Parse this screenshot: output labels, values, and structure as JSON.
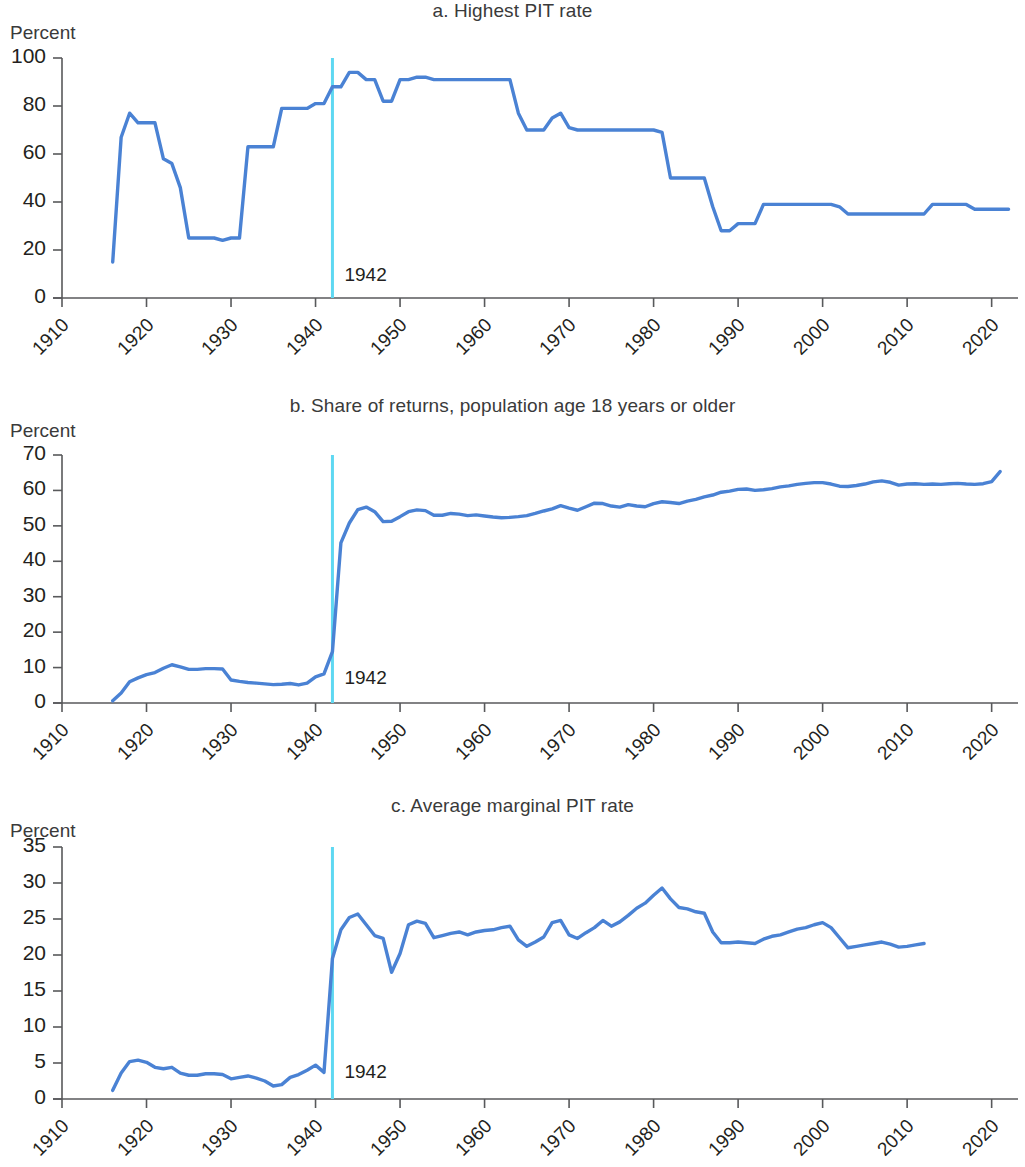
{
  "figure": {
    "axis_unit_label": "Percent",
    "marker_label": "1942",
    "series_color": "#4a82d4",
    "marker_color": "#5ed8f2",
    "axis_color": "#58595b"
  },
  "panels": [
    {
      "key": "a",
      "title": "a. Highest PIT rate",
      "unit": "Percent",
      "annotation": "1942"
    },
    {
      "key": "b",
      "title": "b. Share of returns, population age 18 years or older",
      "unit": "Percent",
      "annotation": "1942"
    },
    {
      "key": "c",
      "title": "c. Average marginal PIT rate",
      "unit": "Percent",
      "annotation": "1942"
    }
  ],
  "chart_data": [
    {
      "type": "line",
      "panel": "a",
      "title": "a. Highest PIT rate",
      "xlabel": "",
      "ylabel": "Percent",
      "xlim": [
        1910,
        2023
      ],
      "ylim": [
        0,
        100
      ],
      "yticks": [
        0,
        20,
        40,
        60,
        80,
        100
      ],
      "xticks": [
        1910,
        1920,
        1930,
        1940,
        1950,
        1960,
        1970,
        1980,
        1990,
        2000,
        2010,
        2020
      ],
      "grid": false,
      "legend": "none",
      "annotations": [
        {
          "type": "vline",
          "x": 1942,
          "label": "1942",
          "color": "#5ed8f2"
        }
      ],
      "series": [
        {
          "name": "Highest PIT rate",
          "color": "#4a82d4",
          "x": [
            1916,
            1917,
            1918,
            1919,
            1920,
            1921,
            1922,
            1923,
            1924,
            1925,
            1926,
            1927,
            1928,
            1929,
            1930,
            1931,
            1932,
            1933,
            1934,
            1935,
            1936,
            1937,
            1938,
            1939,
            1940,
            1941,
            1942,
            1943,
            1944,
            1945,
            1946,
            1947,
            1948,
            1949,
            1950,
            1951,
            1952,
            1953,
            1954,
            1955,
            1956,
            1957,
            1958,
            1959,
            1960,
            1961,
            1962,
            1963,
            1964,
            1965,
            1966,
            1967,
            1968,
            1969,
            1970,
            1971,
            1972,
            1973,
            1974,
            1975,
            1976,
            1977,
            1978,
            1979,
            1980,
            1981,
            1982,
            1983,
            1984,
            1985,
            1986,
            1987,
            1988,
            1989,
            1990,
            1991,
            1992,
            1993,
            1994,
            1995,
            1996,
            1997,
            1998,
            1999,
            2000,
            2001,
            2002,
            2003,
            2004,
            2005,
            2006,
            2007,
            2008,
            2009,
            2010,
            2011,
            2012,
            2013,
            2014,
            2015,
            2016,
            2017,
            2018,
            2019,
            2020,
            2021,
            2022
          ],
          "y": [
            15,
            67,
            77,
            73,
            73,
            73,
            58,
            56,
            46,
            25,
            25,
            25,
            25,
            24,
            25,
            25,
            63,
            63,
            63,
            63,
            79,
            79,
            79,
            79,
            81,
            81,
            88,
            88,
            94,
            94,
            91,
            91,
            82,
            82,
            91,
            91,
            92,
            92,
            91,
            91,
            91,
            91,
            91,
            91,
            91,
            91,
            91,
            91,
            77,
            70,
            70,
            70,
            75,
            77,
            71,
            70,
            70,
            70,
            70,
            70,
            70,
            70,
            70,
            70,
            70,
            69,
            50,
            50,
            50,
            50,
            50,
            38,
            28,
            28,
            31,
            31,
            31,
            39,
            39,
            39,
            39,
            39,
            39,
            39,
            39,
            39,
            38,
            35,
            35,
            35,
            35,
            35,
            35,
            35,
            35,
            35,
            35,
            39,
            39,
            39,
            39,
            39,
            37,
            37,
            37,
            37,
            37
          ]
        }
      ]
    },
    {
      "type": "line",
      "panel": "b",
      "title": "b. Share of returns, population age 18 years or older",
      "xlabel": "",
      "ylabel": "Percent",
      "xlim": [
        1910,
        2023
      ],
      "ylim": [
        0,
        70
      ],
      "yticks": [
        0,
        10,
        20,
        30,
        40,
        50,
        60,
        70
      ],
      "xticks": [
        1910,
        1920,
        1930,
        1940,
        1950,
        1960,
        1970,
        1980,
        1990,
        2000,
        2010,
        2020
      ],
      "grid": false,
      "legend": "none",
      "annotations": [
        {
          "type": "vline",
          "x": 1942,
          "label": "1942",
          "color": "#5ed8f2"
        }
      ],
      "series": [
        {
          "name": "Share of returns",
          "color": "#4a82d4",
          "x": [
            1916,
            1917,
            1918,
            1919,
            1920,
            1921,
            1922,
            1923,
            1924,
            1925,
            1926,
            1927,
            1928,
            1929,
            1930,
            1931,
            1932,
            1933,
            1934,
            1935,
            1936,
            1937,
            1938,
            1939,
            1940,
            1941,
            1942,
            1943,
            1944,
            1945,
            1946,
            1947,
            1948,
            1949,
            1950,
            1951,
            1952,
            1953,
            1954,
            1955,
            1956,
            1957,
            1958,
            1959,
            1960,
            1961,
            1962,
            1963,
            1964,
            1965,
            1966,
            1967,
            1968,
            1969,
            1970,
            1971,
            1972,
            1973,
            1974,
            1975,
            1976,
            1977,
            1978,
            1979,
            1980,
            1981,
            1982,
            1983,
            1984,
            1985,
            1986,
            1987,
            1988,
            1989,
            1990,
            1991,
            1992,
            1993,
            1994,
            1995,
            1996,
            1997,
            1998,
            1999,
            2000,
            2001,
            2002,
            2003,
            2004,
            2005,
            2006,
            2007,
            2008,
            2009,
            2010,
            2011,
            2012,
            2013,
            2014,
            2015,
            2016,
            2017,
            2018,
            2019,
            2020,
            2021
          ],
          "y": [
            0.6,
            2.8,
            6.0,
            7.1,
            8.0,
            8.6,
            9.8,
            10.8,
            10.2,
            9.5,
            9.5,
            9.7,
            9.7,
            9.6,
            6.5,
            6.1,
            5.8,
            5.6,
            5.4,
            5.2,
            5.3,
            5.5,
            5.1,
            5.6,
            7.4,
            8.2,
            14.5,
            45.2,
            50.8,
            54.6,
            55.3,
            54.0,
            51.2,
            51.3,
            52.6,
            54.0,
            54.5,
            54.3,
            53.0,
            53.0,
            53.5,
            53.3,
            52.9,
            53.1,
            52.8,
            52.5,
            52.3,
            52.4,
            52.6,
            52.9,
            53.5,
            54.2,
            54.8,
            55.7,
            55.0,
            54.4,
            55.4,
            56.4,
            56.3,
            55.6,
            55.3,
            56.0,
            55.6,
            55.4,
            56.3,
            56.8,
            56.6,
            56.3,
            57.0,
            57.5,
            58.2,
            58.7,
            59.5,
            59.8,
            60.3,
            60.4,
            60.0,
            60.2,
            60.5,
            61.0,
            61.3,
            61.7,
            62.0,
            62.2,
            62.2,
            61.8,
            61.2,
            61.1,
            61.4,
            61.8,
            62.4,
            62.7,
            62.3,
            61.5,
            61.8,
            61.9,
            61.7,
            61.8,
            61.7,
            61.9,
            62.0,
            61.8,
            61.7,
            61.9,
            62.5,
            65.3
          ]
        }
      ]
    },
    {
      "type": "line",
      "panel": "c",
      "title": "c. Average marginal PIT rate",
      "xlabel": "",
      "ylabel": "Percent",
      "xlim": [
        1910,
        2023
      ],
      "ylim": [
        0,
        35
      ],
      "yticks": [
        0,
        5,
        10,
        15,
        20,
        25,
        30,
        35
      ],
      "xticks": [
        1910,
        1920,
        1930,
        1940,
        1950,
        1960,
        1970,
        1980,
        1990,
        2000,
        2010,
        2020
      ],
      "grid": false,
      "legend": "none",
      "annotations": [
        {
          "type": "vline",
          "x": 1942,
          "label": "1942",
          "color": "#5ed8f2"
        }
      ],
      "series": [
        {
          "name": "Average marginal PIT rate",
          "color": "#4a82d4",
          "x": [
            1916,
            1917,
            1918,
            1919,
            1920,
            1921,
            1922,
            1923,
            1924,
            1925,
            1926,
            1927,
            1928,
            1929,
            1930,
            1931,
            1932,
            1933,
            1934,
            1935,
            1936,
            1937,
            1938,
            1939,
            1940,
            1941,
            1942,
            1943,
            1944,
            1945,
            1946,
            1947,
            1948,
            1949,
            1950,
            1951,
            1952,
            1953,
            1954,
            1955,
            1956,
            1957,
            1958,
            1959,
            1960,
            1961,
            1962,
            1963,
            1964,
            1965,
            1966,
            1967,
            1968,
            1969,
            1970,
            1971,
            1972,
            1973,
            1974,
            1975,
            1976,
            1977,
            1978,
            1979,
            1980,
            1981,
            1982,
            1983,
            1984,
            1985,
            1986,
            1987,
            1988,
            1989,
            1990,
            1991,
            1992,
            1993,
            1994,
            1995,
            1996,
            1997,
            1998,
            1999,
            2000,
            2001,
            2002,
            2003,
            2004,
            2005,
            2006,
            2007,
            2008,
            2009,
            2010,
            2011,
            2012
          ],
          "y": [
            1.2,
            3.6,
            5.2,
            5.4,
            5.1,
            4.4,
            4.2,
            4.4,
            3.6,
            3.3,
            3.3,
            3.5,
            3.5,
            3.4,
            2.8,
            3.0,
            3.2,
            2.9,
            2.5,
            1.8,
            2.0,
            3.0,
            3.4,
            4.0,
            4.7,
            3.7,
            19.5,
            23.5,
            25.2,
            25.7,
            24.2,
            22.7,
            22.3,
            17.6,
            20.2,
            24.2,
            24.7,
            24.4,
            22.4,
            22.7,
            23.0,
            23.2,
            22.8,
            23.2,
            23.4,
            23.5,
            23.8,
            24.0,
            22.1,
            21.2,
            21.8,
            22.5,
            24.5,
            24.8,
            22.8,
            22.3,
            23.1,
            23.8,
            24.8,
            24.0,
            24.6,
            25.5,
            26.5,
            27.2,
            28.3,
            29.3,
            27.8,
            26.6,
            26.4,
            26.0,
            25.8,
            23.2,
            21.7,
            21.7,
            21.8,
            21.7,
            21.6,
            22.2,
            22.6,
            22.8,
            23.2,
            23.6,
            23.8,
            24.2,
            24.5,
            23.8,
            22.4,
            21.0,
            21.2,
            21.4,
            21.6,
            21.8,
            21.5,
            21.1,
            21.2,
            21.4,
            21.6
          ]
        }
      ]
    }
  ]
}
